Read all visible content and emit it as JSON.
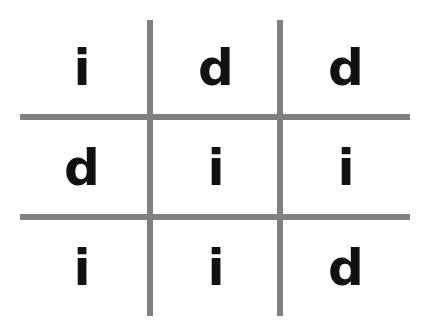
{
  "grid": {
    "rows": [
      [
        "i",
        "d",
        "d"
      ],
      [
        "d",
        "i",
        "i"
      ],
      [
        "i",
        "i",
        "d"
      ]
    ]
  },
  "colors": {
    "line": "#808080",
    "letter": "#111111",
    "background": "#ffffff"
  }
}
